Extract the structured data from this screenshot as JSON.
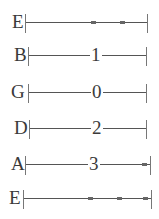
{
  "tab": {
    "strings": [
      {
        "name": "E",
        "fret": "",
        "muted_marks": 2,
        "end_mark": false
      },
      {
        "name": "B",
        "fret": "1",
        "muted_marks": 0,
        "end_mark": false
      },
      {
        "name": "G",
        "fret": "0",
        "muted_marks": 0,
        "end_mark": false
      },
      {
        "name": "D",
        "fret": "2",
        "muted_marks": 0,
        "end_mark": false
      },
      {
        "name": "A",
        "fret": "3",
        "muted_marks": 0,
        "end_mark": true
      },
      {
        "name": "E",
        "fret": "",
        "muted_marks": 2,
        "end_mark": true
      }
    ]
  }
}
